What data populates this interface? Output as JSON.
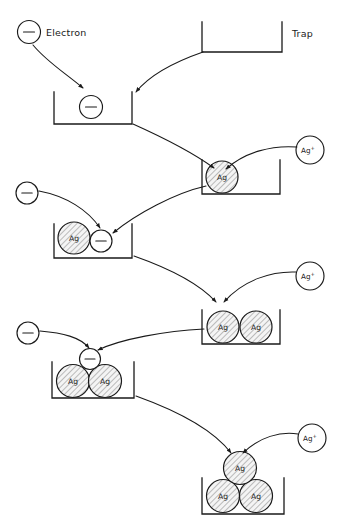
{
  "figure": {
    "background_color": "#ffffff",
    "ink_color": "#1a1a1a",
    "hatch_fill_color": "#f2f2f2",
    "width": 341,
    "height": 522
  },
  "labels": {
    "electron": "Electron",
    "trap": "Trap",
    "silver_atom": "Ag",
    "silver_ion_base": "Ag",
    "silver_ion_charge": "+",
    "electron_symbol": "−"
  },
  "stages": [
    {
      "id": "stage-1",
      "caption_electron": "Electron",
      "caption_trap": "Trap",
      "trap_contents": [
        "electron"
      ],
      "incoming": [
        "electron",
        "trap"
      ]
    },
    {
      "id": "stage-2",
      "trap_contents": [
        "Ag"
      ],
      "incoming": [
        "electron-filled-trap",
        "Ag+"
      ]
    },
    {
      "id": "stage-3",
      "trap_contents": [
        "Ag",
        "electron"
      ],
      "incoming": [
        "electron",
        "Ag-trap"
      ]
    },
    {
      "id": "stage-4",
      "trap_contents": [
        "Ag",
        "Ag"
      ],
      "incoming": [
        "Ag-electron-trap",
        "Ag+"
      ]
    },
    {
      "id": "stage-5",
      "trap_contents": [
        "Ag",
        "Ag",
        "electron"
      ],
      "incoming": [
        "electron",
        "Ag2-trap"
      ]
    },
    {
      "id": "stage-6",
      "trap_contents": [
        "Ag",
        "Ag",
        "Ag"
      ],
      "incoming": [
        "Ag2-electron-trap",
        "Ag+"
      ]
    }
  ],
  "free_electrons": [
    {
      "id": "electron-1",
      "cx": 29,
      "cy": 32,
      "r": 11.5
    },
    {
      "id": "electron-2",
      "cx": 27,
      "cy": 193,
      "r": 11
    },
    {
      "id": "electron-3",
      "cx": 28,
      "cy": 333,
      "r": 11
    }
  ],
  "silver_ions": [
    {
      "id": "silver-ion-1",
      "cx": 310,
      "cy": 150,
      "r": 14
    },
    {
      "id": "silver-ion-2",
      "cx": 310,
      "cy": 276,
      "r": 14
    },
    {
      "id": "silver-ion-3",
      "cx": 312,
      "cy": 438,
      "r": 14
    }
  ],
  "traps": [
    {
      "id": "trap-empty",
      "x": 202,
      "y": 22,
      "w": 80,
      "h": 30
    },
    {
      "id": "trap-electron",
      "x": 54,
      "y": 92,
      "w": 78,
      "h": 32
    },
    {
      "id": "trap-ag1",
      "x": 202,
      "y": 160,
      "w": 78,
      "h": 34
    },
    {
      "id": "trap-ag1-e",
      "x": 54,
      "y": 224,
      "w": 78,
      "h": 34
    },
    {
      "id": "trap-ag2",
      "x": 202,
      "y": 310,
      "w": 78,
      "h": 34
    },
    {
      "id": "trap-ag2-e",
      "x": 52,
      "y": 362,
      "w": 82,
      "h": 36
    },
    {
      "id": "trap-ag3",
      "x": 202,
      "y": 478,
      "w": 82,
      "h": 36
    }
  ]
}
